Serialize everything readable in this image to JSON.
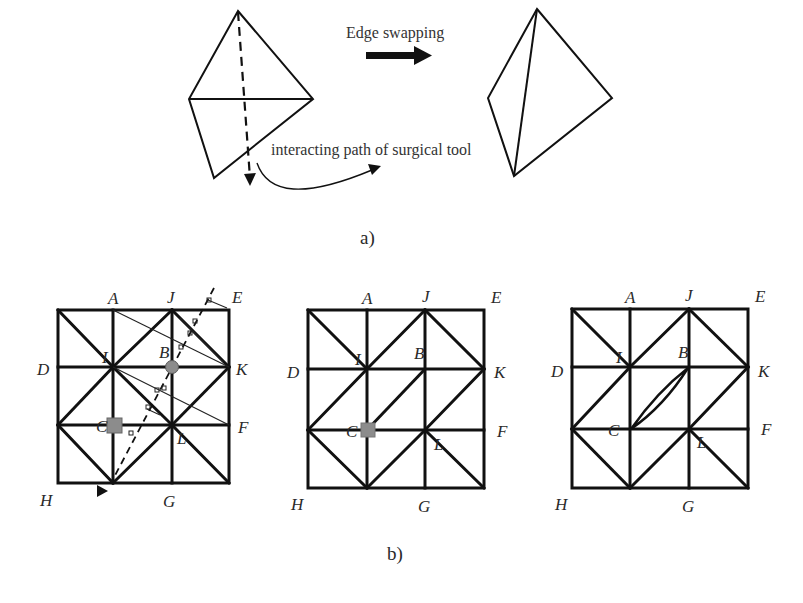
{
  "panel_a": {
    "caption": "a)",
    "arrow_label": "Edge swapping",
    "path_label": "interacting path of surgical tool"
  },
  "panel_b": {
    "caption": "b)",
    "grids": [
      {
        "name": "grid-before",
        "labels": {
          "A": "A",
          "J": "J",
          "E": "E",
          "D": "D",
          "I": "I",
          "B": "B",
          "K": "K",
          "C": "C",
          "L": "L",
          "F": "F",
          "H": "H",
          "G": "G"
        }
      },
      {
        "name": "grid-swapping",
        "labels": {
          "A": "A",
          "J": "J",
          "E": "E",
          "D": "D",
          "I": "I",
          "B": "B",
          "K": "K",
          "C": "C",
          "L": "L",
          "F": "F",
          "H": "H",
          "G": "G"
        }
      },
      {
        "name": "grid-after",
        "labels": {
          "A": "A",
          "J": "J",
          "E": "E",
          "D": "D",
          "I": "I",
          "B": "B",
          "K": "K",
          "C": "C",
          "L": "L",
          "F": "F",
          "H": "H",
          "G": "G"
        }
      }
    ]
  },
  "colors": {
    "line": "#111111",
    "marker_fill": "#8c8c8c",
    "background": "#ffffff"
  }
}
